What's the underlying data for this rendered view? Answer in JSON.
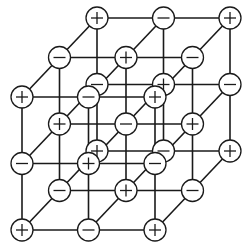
{
  "diagram": {
    "title": "",
    "type": "cubic ionic crystal lattice (3x3x3)",
    "colors": {
      "line": "#1a1a1a",
      "node_fill": "#ffffff",
      "background": "#ffffff"
    },
    "geometry": {
      "front_x": [
        22,
        88.5,
        155
      ],
      "front_y": [
        97,
        163.5,
        230
      ],
      "depth_dx": 37.5,
      "depth_dy": -39.5,
      "node_radius": 11
    },
    "symbols": {
      "positive": "+",
      "negative": "−"
    },
    "rule": "sign = '+' when (column + row + depth) is even, '−' when odd; front top-left is '+'",
    "layers": [
      {
        "name": "front",
        "rows": [
          [
            "+",
            "−",
            "+"
          ],
          [
            "−",
            "+",
            "−"
          ],
          [
            "+",
            "−",
            "+"
          ]
        ]
      },
      {
        "name": "middle",
        "rows": [
          [
            "−",
            "+",
            "−"
          ],
          [
            "+",
            "−",
            "+"
          ],
          [
            "−",
            "+",
            "−"
          ]
        ]
      },
      {
        "name": "back",
        "rows": [
          [
            "+",
            "−",
            "+"
          ],
          [
            "−",
            "+",
            "−"
          ],
          [
            "+",
            "−",
            "+"
          ]
        ]
      }
    ]
  }
}
